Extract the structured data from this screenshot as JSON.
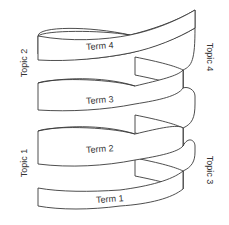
{
  "diagram": {
    "type": "helical-ribbon",
    "stroke_color": "#3a3a3a",
    "fill_color": "#ffffff",
    "terms": [
      {
        "label": "Term 4"
      },
      {
        "label": "Term 3"
      },
      {
        "label": "Term 2"
      },
      {
        "label": "Term 1"
      }
    ],
    "topics": {
      "left_upper": "Topic 2",
      "left_lower": "Topic 1",
      "right_upper": "Topic 4",
      "right_lower": "Topic 3"
    }
  }
}
